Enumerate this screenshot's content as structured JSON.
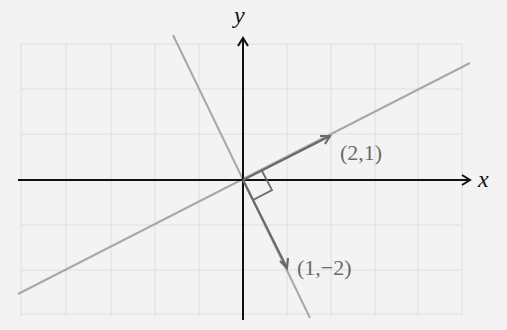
{
  "axes": {
    "x_label": "x",
    "y_label": "y"
  },
  "vectors": [
    {
      "label": "(2,1)",
      "x": 2,
      "y": 1
    },
    {
      "label": "(1,−2)",
      "x": 1,
      "y": -2
    }
  ],
  "lines": [
    {
      "name": "span of (2,1)",
      "slope": 0.5
    },
    {
      "name": "span of (1,-2)",
      "slope": -2
    }
  ],
  "annotations": {
    "right_angle_marker": true
  },
  "colors": {
    "background": "#f3f3f3",
    "grid": "#dedede",
    "axis": "#111111",
    "line": "#a8a8a8",
    "vector": "#6a6a6a"
  },
  "grid": {
    "x_range": [
      -5,
      5
    ],
    "y_range": [
      -3,
      3
    ],
    "spacing_px": 44
  }
}
